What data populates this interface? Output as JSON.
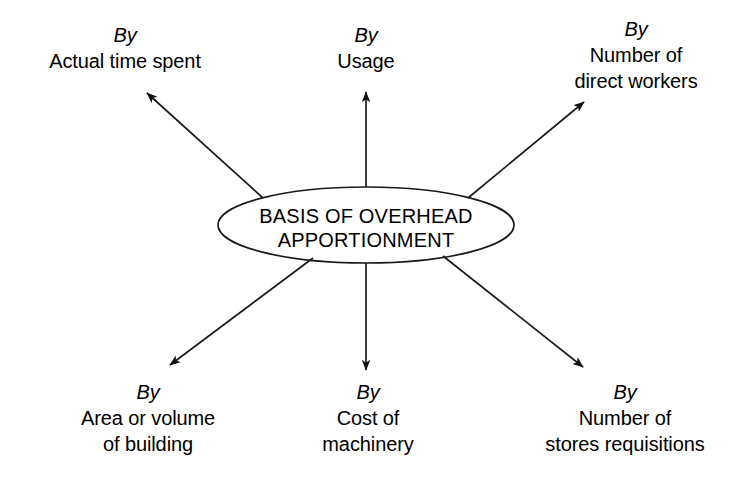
{
  "diagram": {
    "type": "spoke-diagram",
    "title": "Basis of overhead apportionment",
    "center": {
      "line1": "BASIS OF OVERHEAD",
      "line2": "APPORTIONMENT",
      "shape": "ellipse"
    },
    "colors": {
      "background": "#ffffff",
      "stroke": "#1a1a1a",
      "text": "#000000"
    },
    "spokes": [
      {
        "id": "actual-time-spent",
        "position": "top-left",
        "prefix": "By",
        "lines": [
          "Actual time spent"
        ]
      },
      {
        "id": "usage",
        "position": "top-center",
        "prefix": "By",
        "lines": [
          "Usage"
        ]
      },
      {
        "id": "number-of-direct-workers",
        "position": "top-right",
        "prefix": "By",
        "lines": [
          "Number of",
          "direct workers"
        ]
      },
      {
        "id": "area-or-volume-of-building",
        "position": "bottom-left",
        "prefix": "By",
        "lines": [
          "Area or volume",
          "of building"
        ]
      },
      {
        "id": "cost-of-machinery",
        "position": "bottom-center",
        "prefix": "By",
        "lines": [
          "Cost of",
          "machinery"
        ]
      },
      {
        "id": "number-of-stores-requisitions",
        "position": "bottom-right",
        "prefix": "By",
        "lines": [
          "Number of",
          "stores requisitions"
        ]
      }
    ]
  }
}
